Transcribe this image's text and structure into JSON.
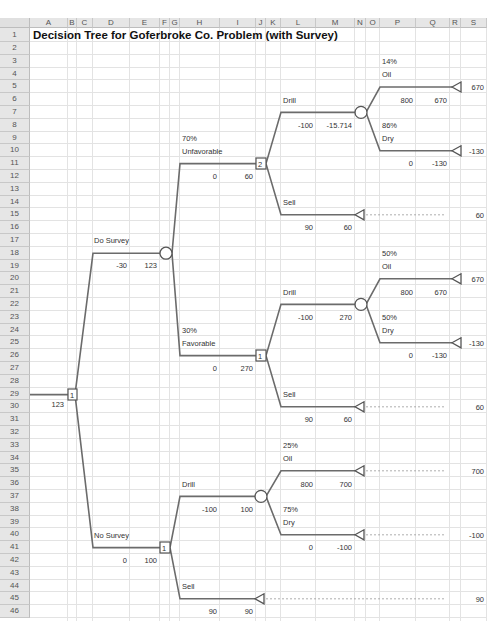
{
  "spreadsheet": {
    "columns": [
      {
        "name": "A",
        "x": 30,
        "w": 38
      },
      {
        "name": "B",
        "x": 68,
        "w": 9
      },
      {
        "name": "C",
        "x": 77,
        "w": 16
      },
      {
        "name": "D",
        "x": 93,
        "w": 37
      },
      {
        "name": "E",
        "x": 130,
        "w": 30
      },
      {
        "name": "F",
        "x": 160,
        "w": 10
      },
      {
        "name": "G",
        "x": 170,
        "w": 10
      },
      {
        "name": "H",
        "x": 180,
        "w": 40
      },
      {
        "name": "I",
        "x": 220,
        "w": 36
      },
      {
        "name": "J",
        "x": 256,
        "w": 10
      },
      {
        "name": "K",
        "x": 266,
        "w": 15
      },
      {
        "name": "L",
        "x": 281,
        "w": 35
      },
      {
        "name": "M",
        "x": 316,
        "w": 39
      },
      {
        "name": "N",
        "x": 355,
        "w": 11
      },
      {
        "name": "O",
        "x": 366,
        "w": 14
      },
      {
        "name": "P",
        "x": 380,
        "w": 36
      },
      {
        "name": "Q",
        "x": 416,
        "w": 34
      },
      {
        "name": "R",
        "x": 450,
        "w": 11
      },
      {
        "name": "S",
        "x": 461,
        "w": 26
      }
    ],
    "row_count": 46
  },
  "title": "Decision Tree for Goferbroke Co. Problem (with Survey)",
  "tree": {
    "root": {
      "node_label": "1",
      "value": "123"
    },
    "do_survey": {
      "label": "Do Survey",
      "cost": "-30",
      "value": "123"
    },
    "unfavorable": {
      "prob": "70%",
      "label": "Unfavorable",
      "cost": "0",
      "value": "60",
      "node_label": "2",
      "drill": {
        "label": "Drill",
        "cost": "-100",
        "value": "-15.714",
        "oil": {
          "prob": "14%",
          "label": "Oil",
          "payoff": "800",
          "value": "670",
          "terminal": "670"
        },
        "dry": {
          "prob": "86%",
          "label": "Dry",
          "payoff": "0",
          "value": "-130",
          "terminal": "-130"
        }
      },
      "sell": {
        "label": "Sell",
        "payoff": "90",
        "value": "60",
        "terminal": "60"
      }
    },
    "favorable": {
      "prob": "30%",
      "label": "Favorable",
      "cost": "0",
      "value": "270",
      "node_label": "1",
      "drill": {
        "label": "Drill",
        "cost": "-100",
        "value": "270",
        "oil": {
          "prob": "50%",
          "label": "Oil",
          "payoff": "800",
          "value": "670",
          "terminal": "670"
        },
        "dry": {
          "prob": "50%",
          "label": "Dry",
          "payoff": "0",
          "value": "-130",
          "terminal": "-130"
        }
      },
      "sell": {
        "label": "Sell",
        "payoff": "90",
        "value": "60",
        "terminal": "60"
      }
    },
    "no_survey": {
      "label": "No Survey",
      "cost": "0",
      "value": "100",
      "node_label": "1",
      "drill": {
        "label": "Drill",
        "cost": "-100",
        "value": "100",
        "oil": {
          "prob": "25%",
          "label": "Oil",
          "payoff": "800",
          "value": "700",
          "terminal": "700"
        },
        "dry": {
          "prob": "75%",
          "label": "Dry",
          "payoff": "0",
          "value": "-100",
          "terminal": "-100"
        }
      },
      "sell": {
        "label": "Sell",
        "payoff": "90",
        "value": "90",
        "terminal": "90"
      }
    }
  },
  "colors": {
    "line": "#6b6b6b",
    "grid": "#e3e3e3",
    "header_bg": "#e6e6e6"
  }
}
